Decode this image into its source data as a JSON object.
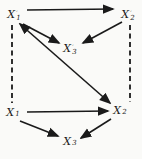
{
  "figure": {
    "width": 142,
    "height": 159,
    "background_color": "#fafaf8",
    "ink_color": "#1a1a1a"
  },
  "nodes": [
    {
      "id": "x1-prime",
      "base": "X",
      "prime": "′",
      "sub": "1",
      "x": 14,
      "y": 14
    },
    {
      "id": "x2-prime",
      "base": "X",
      "prime": "′",
      "sub": "2",
      "x": 128,
      "y": 14
    },
    {
      "id": "x3-prime",
      "base": "X",
      "prime": "′",
      "sub": "3",
      "x": 70,
      "y": 48
    },
    {
      "id": "x1",
      "base": "X",
      "prime": "",
      "sub": "1",
      "x": 13,
      "y": 112
    },
    {
      "id": "x2",
      "base": "X",
      "prime": "",
      "sub": "2",
      "x": 120,
      "y": 110
    },
    {
      "id": "x3",
      "base": "X",
      "prime": "",
      "sub": "3",
      "x": 70,
      "y": 141
    }
  ],
  "edges": [
    {
      "from": "x1-prime",
      "to": "x2-prime",
      "x1": 27,
      "y1": 10,
      "x2": 113,
      "y2": 9,
      "style": "solid",
      "arrows": "end"
    },
    {
      "from": "x1-prime",
      "to": "x3-prime",
      "x1": 23,
      "y1": 24,
      "x2": 59,
      "y2": 43,
      "style": "solid",
      "arrows": "end"
    },
    {
      "from": "x2-prime",
      "to": "x3-prime",
      "x1": 122,
      "y1": 22,
      "x2": 83,
      "y2": 43,
      "style": "solid",
      "arrows": "end"
    },
    {
      "from": "x1-prime",
      "to": "x2",
      "x1": 20,
      "y1": 24,
      "x2": 110,
      "y2": 103,
      "style": "solid",
      "arrows": "both"
    },
    {
      "from": "x1",
      "to": "x2",
      "x1": 27,
      "y1": 112,
      "x2": 108,
      "y2": 111,
      "style": "solid",
      "arrows": "end"
    },
    {
      "from": "x1",
      "to": "x3",
      "x1": 20,
      "y1": 121,
      "x2": 58,
      "y2": 136,
      "style": "solid",
      "arrows": "end"
    },
    {
      "from": "x2",
      "to": "x3",
      "x1": 111,
      "y1": 119,
      "x2": 81,
      "y2": 138,
      "style": "solid",
      "arrows": "end"
    },
    {
      "from": "x1-prime",
      "to": "x1",
      "x1": 12,
      "y1": 25,
      "x2": 12,
      "y2": 103,
      "style": "dashed",
      "arrows": "none"
    },
    {
      "from": "x2-prime",
      "to": "x2",
      "x1": 130,
      "y1": 25,
      "x2": 130,
      "y2": 102,
      "style": "dashed",
      "arrows": "none"
    }
  ]
}
